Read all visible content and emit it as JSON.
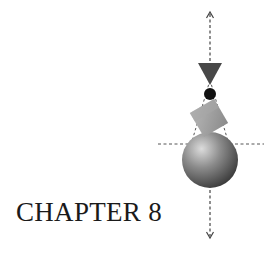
{
  "title": "CHAPTER 8",
  "illustration": {
    "description": "Stacked shapes balanced on a vertical axis: inverted triangle, black dot, tilted cube, sphere",
    "colors": {
      "triangle": "#4a4a4a",
      "dot": "#111111",
      "cube_light": "#b5b5b5",
      "cube_dark": "#8a8a8a",
      "sphere_highlight": "#d8d8d8",
      "sphere_shadow": "#3c3c3c",
      "dashes": "#444444"
    }
  }
}
